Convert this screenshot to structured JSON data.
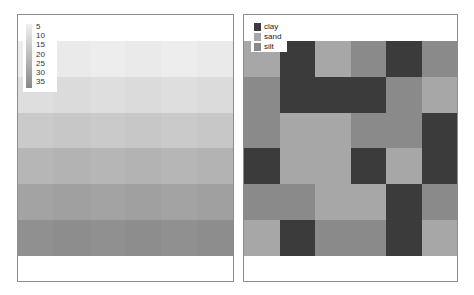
{
  "chart_data": [
    {
      "type": "heatmap",
      "title": "",
      "legend": {
        "type": "colorbar",
        "ticks": [
          "5",
          "10",
          "15",
          "20",
          "25",
          "30",
          "35"
        ],
        "position": "top-left"
      },
      "rows": 6,
      "cols": 6,
      "values": [
        [
          8,
          8,
          8,
          8,
          8,
          8
        ],
        [
          13,
          13,
          13,
          13,
          13,
          13
        ],
        [
          18,
          18,
          18,
          18,
          18,
          18
        ],
        [
          23,
          23,
          23,
          23,
          23,
          23
        ],
        [
          28,
          28,
          28,
          28,
          28,
          28
        ],
        [
          33,
          33,
          33,
          33,
          33,
          33
        ]
      ],
      "row_colors": [
        "#ececec",
        "#dddddd",
        "#c9c9c9",
        "#b5b5b5",
        "#a2a2a2",
        "#8f8f8f"
      ]
    },
    {
      "type": "heatmap",
      "title": "",
      "legend": {
        "type": "categorical",
        "entries": [
          "clay",
          "sand",
          "silt"
        ],
        "position": "top-left"
      },
      "categories": [
        "clay",
        "sand",
        "silt"
      ],
      "colors": {
        "clay": "#3b3b3b",
        "sand": "#a7a7a7",
        "silt": "#8a8a8a"
      },
      "rows": 6,
      "cols": 6,
      "values": [
        [
          "sand",
          "clay",
          "sand",
          "silt",
          "clay",
          "silt"
        ],
        [
          "silt",
          "clay",
          "clay",
          "clay",
          "silt",
          "sand"
        ],
        [
          "silt",
          "sand",
          "sand",
          "silt",
          "silt",
          "clay"
        ],
        [
          "clay",
          "sand",
          "sand",
          "clay",
          "sand",
          "clay"
        ],
        [
          "silt",
          "silt",
          "sand",
          "sand",
          "clay",
          "silt"
        ],
        [
          "sand",
          "clay",
          "silt",
          "silt",
          "clay",
          "sand"
        ]
      ]
    }
  ],
  "left_legend": {
    "ticks": [
      "5",
      "10",
      "15",
      "20",
      "25",
      "30",
      "35"
    ]
  },
  "right_legend": {
    "labels": [
      "clay",
      "sand",
      "silt"
    ]
  }
}
